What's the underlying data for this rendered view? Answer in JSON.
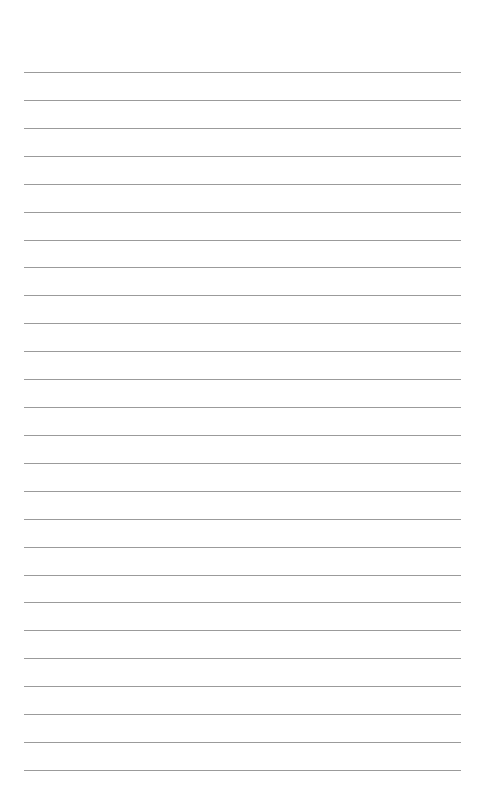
{
  "page": {
    "type": "lined-paper",
    "background_color": "#ffffff",
    "line_color": "#8a8a8a",
    "line_count": 26,
    "first_line_y": 72,
    "line_spacing": 27.92,
    "line_left": 24,
    "line_right": 461
  }
}
